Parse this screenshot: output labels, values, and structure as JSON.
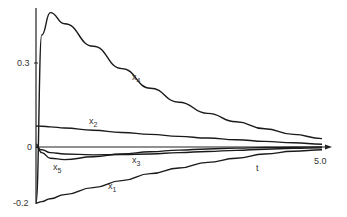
{
  "chart_data": {
    "type": "line",
    "title": "",
    "xlabel": "t",
    "ylabel": "",
    "xlim": [
      0,
      5.0
    ],
    "ylim": [
      -0.2,
      0.5
    ],
    "x_tick_labels": [
      "5.0"
    ],
    "y_tick_labels": [
      "0.3",
      "0",
      "-0.2"
    ],
    "grid": false,
    "legend": "inline curve labels",
    "x": [
      0,
      0.1,
      0.25,
      0.5,
      1.0,
      1.5,
      2.0,
      2.5,
      3.0,
      3.5,
      4.0,
      4.5,
      5.0
    ],
    "series": [
      {
        "name": "x1",
        "label": "x",
        "sub": "1",
        "values": [
          -0.2,
          -0.195,
          -0.185,
          -0.17,
          -0.145,
          -0.12,
          -0.095,
          -0.075,
          -0.055,
          -0.04,
          -0.025,
          -0.015,
          -0.01
        ]
      },
      {
        "name": "x2",
        "label": "x",
        "sub": "2",
        "values": [
          0.075,
          0.074,
          0.072,
          0.068,
          0.06,
          0.052,
          0.045,
          0.038,
          0.032,
          0.026,
          0.02,
          0.015,
          0.01
        ]
      },
      {
        "name": "x3",
        "label": "x",
        "sub": "3",
        "values": [
          0.0,
          -0.01,
          -0.02,
          -0.025,
          -0.028,
          -0.027,
          -0.025,
          -0.02,
          -0.016,
          -0.012,
          -0.008,
          -0.005,
          -0.003
        ]
      },
      {
        "name": "x4",
        "label": "x",
        "sub": "4",
        "values": [
          -0.2,
          0.4,
          0.48,
          0.44,
          0.36,
          0.28,
          0.21,
          0.16,
          0.12,
          0.09,
          0.065,
          0.045,
          0.03
        ]
      },
      {
        "name": "x5",
        "label": "x",
        "sub": "5",
        "values": [
          0.01,
          -0.02,
          -0.04,
          -0.045,
          -0.035,
          -0.025,
          -0.017,
          -0.011,
          -0.007,
          -0.004,
          -0.002,
          -0.001,
          0.0
        ]
      }
    ]
  },
  "labels": {
    "y_top": "0.3",
    "y_zero": "0",
    "y_bottom": "-0.2",
    "x_end": "5.0",
    "x_axis": "t",
    "x1": "x",
    "x1_sub": "1",
    "x2": "x",
    "x2_sub": "2",
    "x3": "x",
    "x3_sub": "3",
    "x4": "x",
    "x4_sub": "4",
    "x5": "x",
    "x5_sub": "5"
  }
}
